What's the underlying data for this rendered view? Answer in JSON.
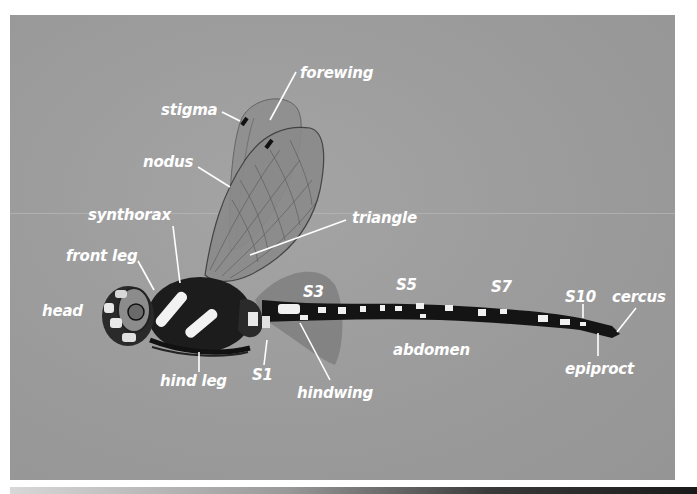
{
  "diagram": {
    "background_color": "#9c9c9c",
    "label_color": "#ffffff",
    "labels": {
      "forewing": "forewing",
      "stigma": "stigma",
      "nodus": "nodus",
      "synthorax": "synthorax",
      "triangle": "triangle",
      "front_leg": "front leg",
      "head": "head",
      "s3": "S3",
      "s5": "S5",
      "s7": "S7",
      "s10": "S10",
      "cercus": "cercus",
      "abdomen": "abdomen",
      "epiproct": "epiproct",
      "hind_leg": "hind leg",
      "s1": "S1",
      "hindwing": "hindwing"
    }
  }
}
